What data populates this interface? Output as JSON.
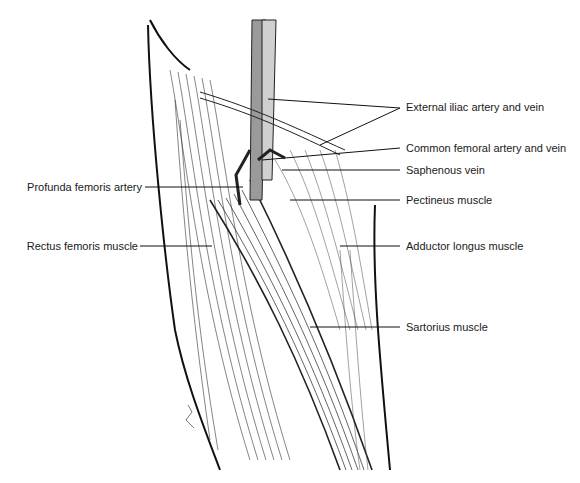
{
  "figure": {
    "labels": {
      "external_iliac": "External iliac artery and vein",
      "common_femoral": "Common femoral artery and vein",
      "saphenous": "Saphenous vein",
      "pectineus": "Pectineus muscle",
      "adductor_longus": "Adductor longus muscle",
      "sartorius": "Sartorius muscle",
      "profunda": "Profunda femoris artery",
      "rectus_femoris": "Rectus femoris muscle"
    }
  }
}
